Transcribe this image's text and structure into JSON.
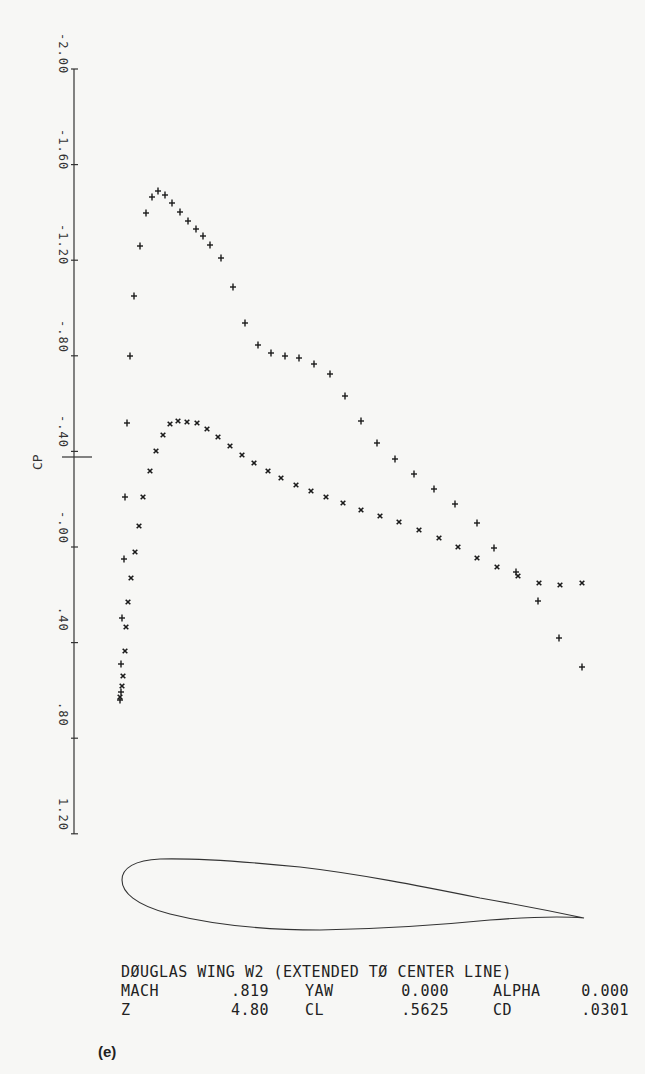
{
  "figure": {
    "label": "(e)"
  },
  "info": {
    "title": "DØUGLAS WING W2 (EXTENDED TØ CENTER LINE)",
    "rows": [
      [
        {
          "k": "MACH",
          "v": ".819"
        },
        {
          "k": "YAW",
          "v": "0.000"
        },
        {
          "k": "ALPHA",
          "v": "0.000"
        }
      ],
      [
        {
          "k": "Z",
          "v": "4.80"
        },
        {
          "k": "CL",
          "v": ".5625"
        },
        {
          "k": "CD",
          "v": ".0301"
        }
      ]
    ]
  },
  "chart_data": {
    "type": "scatter",
    "title": "",
    "xlabel": "",
    "ylabel": "CP",
    "ylim": [
      1.2,
      -2.0
    ],
    "y_inverted": true,
    "yticks": [
      -2.0,
      -1.6,
      -1.2,
      -0.8,
      -0.4,
      0.0,
      0.4,
      0.8,
      1.2
    ],
    "ytick_labels": [
      "-2.00",
      "-1.60",
      "-1.20",
      "-.80",
      "-.40",
      "-.00",
      ".40",
      ".80",
      "1.20"
    ],
    "grid": false,
    "axis_px": {
      "x": 74,
      "y_at_cp0": 547,
      "px_per_unit": 239,
      "y_top": 69,
      "y_bottom": 834
    },
    "series": [
      {
        "name": "upper surface",
        "marker": "+",
        "points_px": [
          [
            120,
            700
          ],
          [
            121,
            692
          ],
          [
            121,
            664
          ],
          [
            122,
            618
          ],
          [
            124,
            559
          ],
          [
            125,
            497
          ],
          [
            127,
            423
          ],
          [
            130,
            356
          ],
          [
            134,
            296
          ],
          [
            140,
            246
          ],
          [
            146,
            213
          ],
          [
            152,
            197
          ],
          [
            158,
            191
          ],
          [
            165,
            195
          ],
          [
            172,
            203
          ],
          [
            180,
            212
          ],
          [
            188,
            221
          ],
          [
            196,
            229
          ],
          [
            203,
            236
          ],
          [
            210,
            245
          ],
          [
            221,
            258
          ],
          [
            233,
            287
          ],
          [
            245,
            323
          ],
          [
            258,
            345
          ],
          [
            271,
            353
          ],
          [
            285,
            356
          ],
          [
            299,
            358
          ],
          [
            314,
            364
          ],
          [
            330,
            374
          ],
          [
            345,
            396
          ],
          [
            361,
            421
          ],
          [
            377,
            443
          ],
          [
            395,
            459
          ],
          [
            414,
            474
          ],
          [
            434,
            489
          ],
          [
            455,
            504
          ],
          [
            477,
            523
          ],
          [
            494,
            548
          ],
          [
            516,
            572
          ],
          [
            538,
            601
          ],
          [
            559,
            638
          ],
          [
            582,
            667
          ]
        ],
        "cp_values": [
          0.64,
          0.61,
          0.49,
          0.3,
          0.05,
          -0.21,
          -0.52,
          -0.8,
          -1.05,
          -1.26,
          -1.4,
          -1.46,
          -1.49,
          -1.47,
          -1.44,
          -1.4,
          -1.36,
          -1.33,
          -1.3,
          -1.26,
          -1.21,
          -1.09,
          -0.94,
          -0.84,
          -0.81,
          -0.8,
          -0.79,
          -0.77,
          -0.72,
          -0.63,
          -0.53,
          -0.44,
          -0.37,
          -0.3,
          -0.24,
          -0.18,
          -0.1,
          0.0,
          0.1,
          0.23,
          0.38,
          0.5
        ]
      },
      {
        "name": "lower surface",
        "marker": "x",
        "points_px": [
          [
            120,
            697
          ],
          [
            122,
            686
          ],
          [
            123,
            676
          ],
          [
            125,
            651
          ],
          [
            126,
            627
          ],
          [
            128,
            602
          ],
          [
            131,
            578
          ],
          [
            135,
            552
          ],
          [
            139,
            526
          ],
          [
            143,
            497
          ],
          [
            150,
            471
          ],
          [
            156,
            451
          ],
          [
            163,
            435
          ],
          [
            170,
            424
          ],
          [
            178,
            421
          ],
          [
            187,
            422
          ],
          [
            197,
            423
          ],
          [
            207,
            429
          ],
          [
            218,
            437
          ],
          [
            230,
            446
          ],
          [
            242,
            455
          ],
          [
            254,
            463
          ],
          [
            268,
            471
          ],
          [
            281,
            478
          ],
          [
            296,
            485
          ],
          [
            311,
            491
          ],
          [
            326,
            497
          ],
          [
            343,
            503
          ],
          [
            361,
            510
          ],
          [
            380,
            516
          ],
          [
            399,
            522
          ],
          [
            419,
            530
          ],
          [
            439,
            538
          ],
          [
            458,
            547
          ],
          [
            477,
            558
          ],
          [
            497,
            567
          ],
          [
            518,
            576
          ],
          [
            539,
            583
          ],
          [
            560,
            585
          ],
          [
            582,
            583
          ]
        ],
        "cp_values": [
          0.63,
          0.58,
          0.54,
          0.44,
          0.33,
          0.23,
          0.13,
          0.02,
          -0.09,
          -0.21,
          -0.32,
          -0.4,
          -0.47,
          -0.51,
          -0.53,
          -0.52,
          -0.52,
          -0.49,
          -0.46,
          -0.42,
          -0.38,
          -0.35,
          -0.32,
          -0.29,
          -0.26,
          -0.23,
          -0.21,
          -0.18,
          -0.15,
          -0.13,
          -0.1,
          -0.07,
          -0.04,
          0.0,
          0.05,
          0.08,
          0.12,
          0.15,
          0.16,
          0.15
        ]
      }
    ],
    "annotations": [
      "airfoil section outline below plot"
    ]
  }
}
